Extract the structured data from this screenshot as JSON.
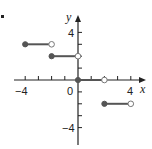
{
  "chart_data": {
    "type": "line",
    "title": "",
    "xlabel": "x",
    "ylabel": "y",
    "xlim": [
      -4.5,
      4.8
    ],
    "ylim": [
      -5,
      5
    ],
    "grid": false,
    "x_ticks": [
      -4,
      -3,
      -2,
      -1,
      0,
      1,
      2,
      3,
      4
    ],
    "y_ticks": [
      -4,
      -3,
      -2,
      -1,
      1,
      2,
      3,
      4
    ],
    "x_tick_labels": [
      "-4",
      "0",
      "4"
    ],
    "y_tick_labels": [
      "4",
      "-4"
    ],
    "series": [
      {
        "name": "step segment 1",
        "x": [
          -4,
          -2
        ],
        "y": [
          3,
          3
        ],
        "left_closed": true,
        "right_closed": false
      },
      {
        "name": "step segment 2",
        "x": [
          -2,
          0
        ],
        "y": [
          2,
          2
        ],
        "left_closed": true,
        "right_closed": false
      },
      {
        "name": "step segment 3",
        "x": [
          0,
          2
        ],
        "y": [
          0,
          0
        ],
        "left_closed": true,
        "right_closed": false
      },
      {
        "name": "step segment 4",
        "x": [
          2,
          4
        ],
        "y": [
          -2,
          -2
        ],
        "left_closed": true,
        "right_closed": false
      }
    ],
    "colors": {
      "axis": "#222222",
      "segment": "#555555",
      "filled_point": "#555555",
      "open_point_fill": "#ffffff"
    }
  },
  "labels": {
    "x_axis": "x",
    "y_axis": "y",
    "x_neg4": "−4",
    "x_zero": "0",
    "x_pos4": "4",
    "y_pos4": "4",
    "y_neg4": "−4"
  }
}
